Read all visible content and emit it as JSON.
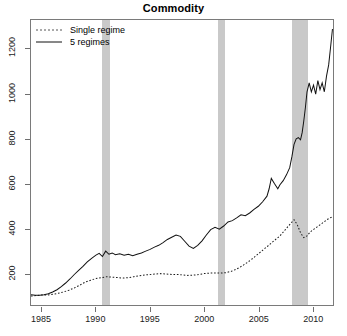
{
  "chart_data": {
    "type": "line",
    "title": "Commodity",
    "xlabel": "",
    "ylabel": "",
    "xlim": [
      1984.0,
      2011.9
    ],
    "ylim": [
      60,
      1330
    ],
    "xticks": [
      1985,
      1990,
      1995,
      2000,
      2005,
      2010
    ],
    "xticklabels": [
      "1985",
      "1990",
      "1995",
      "2000",
      "2005",
      "2010"
    ],
    "yticks": [
      200,
      400,
      600,
      800,
      1000,
      1200
    ],
    "yticklabels": [
      "200",
      "400",
      "600",
      "800",
      "1000",
      "1200"
    ],
    "grid": false,
    "legend_position": "top-left",
    "shaded_bands": [
      {
        "label": "recession-band-1",
        "x0": 1990.55,
        "x1": 1991.25,
        "color": "#c9c9c9"
      },
      {
        "label": "recession-band-2",
        "x0": 2001.2,
        "x1": 2001.85,
        "color": "#c9c9c9"
      },
      {
        "label": "recession-band-3",
        "x0": 2007.95,
        "x1": 2009.45,
        "color": "#c9c9c9"
      }
    ],
    "series": [
      {
        "name": "Single regime",
        "style": "dotted",
        "color": "#1a1a1a",
        "x": [
          1984.0,
          1984.5,
          1985.0,
          1985.5,
          1986.0,
          1986.5,
          1987.0,
          1987.5,
          1988.0,
          1988.5,
          1989.0,
          1989.5,
          1990.0,
          1990.5,
          1991.0,
          1991.5,
          1992.0,
          1992.5,
          1993.0,
          1993.5,
          1994.0,
          1994.5,
          1995.0,
          1995.5,
          1996.0,
          1996.5,
          1997.0,
          1997.5,
          1998.0,
          1998.5,
          1999.0,
          1999.5,
          2000.0,
          2000.5,
          2001.0,
          2001.5,
          2002.0,
          2002.5,
          2003.0,
          2003.5,
          2004.0,
          2004.5,
          2005.0,
          2005.5,
          2006.0,
          2006.5,
          2007.0,
          2007.5,
          2008.0,
          2008.3,
          2008.6,
          2008.9,
          2009.2,
          2009.5,
          2009.8,
          2010.2,
          2010.6,
          2011.0,
          2011.4,
          2011.8
        ],
        "y": [
          100,
          102,
          105,
          104,
          108,
          112,
          118,
          126,
          136,
          148,
          162,
          170,
          178,
          182,
          186,
          184,
          182,
          180,
          182,
          186,
          190,
          194,
          196,
          198,
          200,
          198,
          196,
          196,
          194,
          192,
          193,
          196,
          200,
          202,
          203,
          202,
          204,
          210,
          220,
          234,
          250,
          268,
          288,
          308,
          328,
          348,
          368,
          396,
          424,
          440,
          418,
          382,
          360,
          368,
          386,
          400,
          414,
          428,
          442,
          452
        ]
      },
      {
        "name": "5 regimes",
        "style": "solid",
        "color": "#111111",
        "x": [
          1984.0,
          1984.4,
          1984.8,
          1985.2,
          1985.6,
          1986.0,
          1986.4,
          1986.8,
          1987.2,
          1987.6,
          1988.0,
          1988.4,
          1988.8,
          1989.2,
          1989.6,
          1990.0,
          1990.3,
          1990.6,
          1990.9,
          1991.2,
          1991.5,
          1991.8,
          1992.2,
          1992.6,
          1993.0,
          1993.4,
          1993.8,
          1994.2,
          1994.6,
          1995.0,
          1995.4,
          1995.8,
          1996.2,
          1996.6,
          1997.0,
          1997.4,
          1997.8,
          1998.2,
          1998.6,
          1999.0,
          1999.4,
          1999.8,
          2000.2,
          2000.6,
          2001.0,
          2001.4,
          2001.8,
          2002.2,
          2002.6,
          2003.0,
          2003.4,
          2003.8,
          2004.2,
          2004.6,
          2005.0,
          2005.4,
          2005.8,
          2006.0,
          2006.2,
          2006.5,
          2006.8,
          2007.0,
          2007.3,
          2007.6,
          2007.9,
          2008.1,
          2008.3,
          2008.5,
          2008.7,
          2008.9,
          2009.05,
          2009.2,
          2009.35,
          2009.5,
          2009.7,
          2009.9,
          2010.1,
          2010.3,
          2010.5,
          2010.7,
          2010.9,
          2011.1,
          2011.3,
          2011.5,
          2011.7,
          2011.85
        ],
        "y": [
          106,
          104,
          103,
          106,
          110,
          118,
          128,
          142,
          158,
          176,
          196,
          214,
          232,
          252,
          268,
          282,
          290,
          276,
          300,
          286,
          292,
          284,
          288,
          282,
          286,
          280,
          286,
          292,
          300,
          308,
          318,
          326,
          338,
          352,
          362,
          372,
          366,
          344,
          322,
          312,
          326,
          346,
          372,
          396,
          406,
          398,
          412,
          430,
          436,
          448,
          462,
          458,
          470,
          486,
          500,
          520,
          545,
          578,
          624,
          600,
          578,
          596,
          614,
          640,
          672,
          720,
          776,
          800,
          806,
          796,
          828,
          880,
          940,
          1010,
          1050,
          1010,
          1040,
          1000,
          1060,
          1020,
          1050,
          1010,
          1080,
          1130,
          1220,
          1290
        ]
      }
    ]
  }
}
